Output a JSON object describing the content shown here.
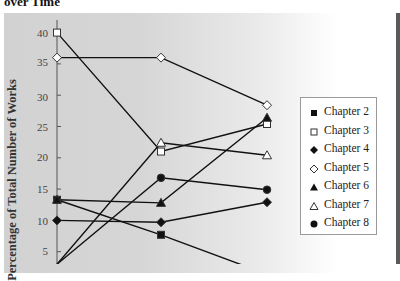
{
  "title": "over Time",
  "chart_data": {
    "type": "line",
    "title": "over Time",
    "xlabel": "",
    "ylabel": "Percentage of Total Number of Works",
    "ylim": [
      0,
      42
    ],
    "yticks": [
      5,
      10,
      15,
      20,
      25,
      30,
      35,
      40
    ],
    "grid": false,
    "legend_position": "right",
    "x": [
      1,
      2,
      3
    ],
    "series": [
      {
        "name": "Chapter 2",
        "marker": "filled-square",
        "values": [
          13.3,
          7.7,
          1.4
        ]
      },
      {
        "name": "Chapter 3",
        "marker": "open-square",
        "values": [
          40,
          21,
          25.4
        ]
      },
      {
        "name": "Chapter 4",
        "marker": "filled-diamond",
        "values": [
          10,
          9.7,
          12.9
        ]
      },
      {
        "name": "Chapter 5",
        "marker": "open-diamond",
        "values": [
          36,
          36,
          28.4
        ]
      },
      {
        "name": "Chapter 6",
        "marker": "filled-triangle",
        "values": [
          13.3,
          12.8,
          26.4
        ]
      },
      {
        "name": "Chapter 7",
        "marker": "open-triangle",
        "values": [
          3,
          22.4,
          20.4
        ]
      },
      {
        "name": "Chapter 8",
        "marker": "filled-circle",
        "values": [
          3,
          16.8,
          14.9
        ]
      }
    ]
  },
  "legend": {
    "items": [
      {
        "label": "Chapter 2",
        "marker": "filled-square"
      },
      {
        "label": "Chapter 3",
        "marker": "open-square"
      },
      {
        "label": "Chapter 4",
        "marker": "filled-diamond"
      },
      {
        "label": "Chapter 5",
        "marker": "open-diamond"
      },
      {
        "label": "Chapter 6",
        "marker": "filled-triangle"
      },
      {
        "label": "Chapter 7",
        "marker": "open-triangle"
      },
      {
        "label": "Chapter 8",
        "marker": "filled-circle"
      }
    ]
  },
  "axis": {
    "ticks": [
      "40",
      "35",
      "30",
      "25",
      "20",
      "15",
      "10",
      "5"
    ]
  },
  "colors": {
    "line": "#111111",
    "panel_left": "#d2d2d2",
    "panel_right": "#ffffff",
    "border": "#5a5a5a"
  }
}
